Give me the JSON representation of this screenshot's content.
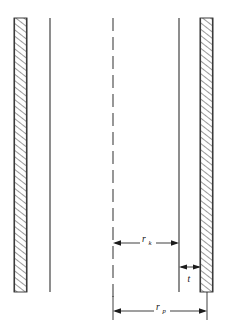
{
  "figure": {
    "type": "engineering-cross-section",
    "background_color": "#ffffff",
    "line_color": "#3a3a3a",
    "hatch_color": "#2b2b2b",
    "dimension_color": "#1c1c1c",
    "width": 227,
    "height": 334
  },
  "walls": [
    {
      "name": "left-hatched-wall",
      "x_left": 14,
      "x_right": 27,
      "y_top": 18,
      "y_bottom": 292,
      "hatched": true
    },
    {
      "name": "right-hatched-wall",
      "x_left": 200,
      "x_right": 213,
      "y_top": 18,
      "y_bottom": 292,
      "hatched": true
    }
  ],
  "lines": [
    {
      "name": "left-inner-line",
      "x": 50,
      "y_top": 18,
      "y_bottom": 292,
      "style": "solid"
    },
    {
      "name": "centerline",
      "x": 113,
      "y_top": 18,
      "y_bottom": 300,
      "style": "dashed"
    },
    {
      "name": "right-inner-line",
      "x": 179,
      "y_top": 18,
      "y_bottom": 292,
      "style": "solid"
    }
  ],
  "dimensions": [
    {
      "name": "radius-k",
      "symbol": "r",
      "subscript": "k",
      "x_start": 113,
      "x_end": 179,
      "y": 243,
      "label_x": 146,
      "label_y": 241,
      "direction": "horizontal-both-arrows"
    },
    {
      "name": "thickness-t",
      "symbol": "t",
      "subscript": "",
      "x_start": 179,
      "x_end": 201,
      "y": 267,
      "label_x": 190,
      "label_y": 281,
      "direction": "horizontal-both-arrows"
    },
    {
      "name": "radius-p",
      "symbol": "r",
      "subscript": "p",
      "x_start": 113,
      "x_end": 207,
      "y": 311,
      "label_x": 160,
      "label_y": 309,
      "direction": "horizontal-both-arrows"
    }
  ],
  "extension_lines": [
    {
      "name": "centerline-extension-bottom",
      "x": 113,
      "y_top": 292,
      "y_bottom": 320
    },
    {
      "name": "right-wall-extension-bottom",
      "x": 207,
      "y_top": 292,
      "y_bottom": 320
    }
  ]
}
